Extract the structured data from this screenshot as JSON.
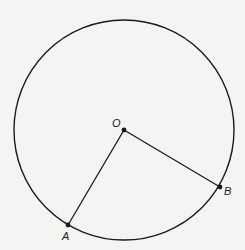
{
  "diagram": {
    "type": "circle-geometry",
    "circle": {
      "center": "O",
      "cx": 124,
      "cy": 130,
      "r": 110
    },
    "points": [
      {
        "name": "O",
        "label": "O",
        "x": 124,
        "y": 130,
        "lx": 112,
        "ly": 127
      },
      {
        "name": "A",
        "label": "A",
        "x": 68,
        "y": 225,
        "lx": 62,
        "ly": 240
      },
      {
        "name": "B",
        "label": "B",
        "x": 220,
        "y": 187,
        "lx": 224,
        "ly": 195
      }
    ],
    "segments": [
      {
        "from": "O",
        "to": "A"
      },
      {
        "from": "O",
        "to": "B"
      }
    ],
    "colors": {
      "stroke": "#1a1a1a",
      "background": "#f4f4f2"
    }
  }
}
